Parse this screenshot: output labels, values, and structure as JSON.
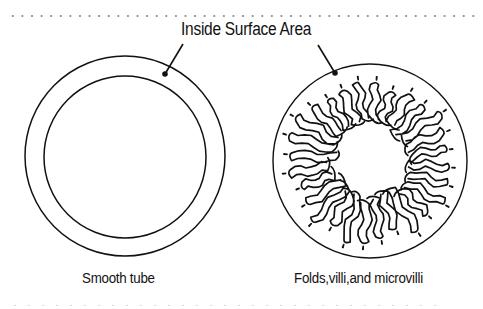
{
  "diagram": {
    "title": "Inside Surface Area",
    "panels": [
      {
        "id": "smooth",
        "caption": "Smooth tube",
        "shape": "concentric-rings",
        "center": [
          125,
          156
        ],
        "outer_radius": 100,
        "inner_radius": 81
      },
      {
        "id": "folded",
        "caption": "Folds,villi,and microvilli",
        "shape": "circle-with-radial-villi",
        "center": [
          370,
          161
        ],
        "outer_radius": 97,
        "villi_count": 28
      }
    ],
    "leaders": [
      {
        "from": [
          183,
          44
        ],
        "to": [
          165,
          74
        ]
      },
      {
        "from": [
          318,
          45
        ],
        "to": [
          335,
          73
        ]
      }
    ],
    "colors": {
      "ink": "#111111",
      "background": "#ffffff",
      "dots": "#9a9a9a"
    }
  }
}
